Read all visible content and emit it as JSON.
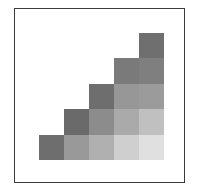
{
  "diagram": {
    "title": "",
    "type": "staircase-grid",
    "rows": 5,
    "cols": 5,
    "cells": [
      {
        "row": 0,
        "col": 4,
        "color": "#6f6f6f"
      },
      {
        "row": 1,
        "col": 3,
        "color": "#7a7a7a"
      },
      {
        "row": 1,
        "col": 4,
        "color": "#7f7f7f"
      },
      {
        "row": 2,
        "col": 2,
        "color": "#6e6e6e"
      },
      {
        "row": 2,
        "col": 3,
        "color": "#979797"
      },
      {
        "row": 2,
        "col": 4,
        "color": "#9b9b9b"
      },
      {
        "row": 3,
        "col": 1,
        "color": "#6a6a6a"
      },
      {
        "row": 3,
        "col": 2,
        "color": "#8c8c8c"
      },
      {
        "row": 3,
        "col": 3,
        "color": "#aaaaaa"
      },
      {
        "row": 3,
        "col": 4,
        "color": "#c0c0c0"
      },
      {
        "row": 4,
        "col": 0,
        "color": "#6e6e6e"
      },
      {
        "row": 4,
        "col": 1,
        "color": "#999999"
      },
      {
        "row": 4,
        "col": 2,
        "color": "#b0b0b0"
      },
      {
        "row": 4,
        "col": 3,
        "color": "#cfcfcf"
      },
      {
        "row": 4,
        "col": 4,
        "color": "#e0e0e0"
      }
    ]
  }
}
